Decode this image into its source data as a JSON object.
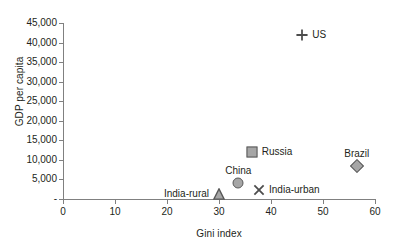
{
  "chart_data": {
    "type": "scatter",
    "title": "",
    "xlabel": "Gini index",
    "ylabel": "GDP per capita",
    "xlim": [
      0,
      60
    ],
    "ylim": [
      0,
      45000
    ],
    "xticks": [
      "0",
      "10",
      "20",
      "30",
      "40",
      "50",
      "60"
    ],
    "xtick_values": [
      0,
      10,
      20,
      30,
      40,
      50,
      60
    ],
    "yticks": [
      "-",
      "5,000",
      "10,000",
      "15,000",
      "20,000",
      "25,000",
      "30,000",
      "35,000",
      "40,000",
      "45,000"
    ],
    "ytick_values": [
      0,
      5000,
      10000,
      15000,
      20000,
      25000,
      30000,
      35000,
      40000,
      45000
    ],
    "grid": false,
    "legend": "none",
    "points": [
      {
        "name": "US",
        "label": "US",
        "x": 46.0,
        "y": 42000,
        "marker": "plus",
        "label_position": "right"
      },
      {
        "name": "Russia",
        "label": "Russia",
        "x": 36.3,
        "y": 12000,
        "marker": "square",
        "label_position": "right"
      },
      {
        "name": "Brazil",
        "label": "Brazil",
        "x": 56.5,
        "y": 8500,
        "marker": "diamond",
        "label_position": "above"
      },
      {
        "name": "China",
        "label": "China",
        "x": 33.7,
        "y": 4200,
        "marker": "circle",
        "label_position": "above"
      },
      {
        "name": "India-urban",
        "label": "India-urban",
        "x": 37.7,
        "y": 2200,
        "marker": "cross",
        "label_position": "right"
      },
      {
        "name": "India-rural",
        "label": "India-rural",
        "x": 30.0,
        "y": 1400,
        "marker": "triangle",
        "label_position": "left"
      }
    ],
    "colors": {
      "marker_fill": "#a6a6a6",
      "marker_stroke": "#595959",
      "axis": "#808080",
      "text": "#231f20",
      "background": "#ffffff"
    }
  }
}
